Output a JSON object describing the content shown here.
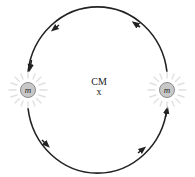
{
  "diagram": {
    "center_label": "CM",
    "center_marker": "x",
    "mass_label": "m",
    "stars": [
      {
        "id": "left-star",
        "label": "m",
        "cx": 28,
        "cy": 90
      },
      {
        "id": "right-star",
        "label": "m",
        "cx": 167,
        "cy": 90
      }
    ],
    "orbit": {
      "cx": 97.5,
      "cy": 89,
      "rx": 70,
      "ry": 74,
      "direction": "counterclockwise"
    },
    "colors": {
      "orbit_stroke": "#222222",
      "star_fill": "#c8c8c8",
      "star_stroke": "#8a8a8a",
      "glow": "#e2e2e2",
      "text": "#222222"
    }
  }
}
